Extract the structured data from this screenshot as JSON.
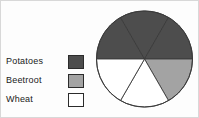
{
  "legend": {
    "items": [
      {
        "label": "Potatoes",
        "color": "#4d4d4d",
        "swatch": "dark-gray-swatch"
      },
      {
        "label": "Beetroot",
        "color": "#a3a3a3",
        "swatch": "medium-gray-swatch"
      },
      {
        "label": "Wheat",
        "color": "#ffffff",
        "swatch": "white-swatch"
      }
    ]
  },
  "chart_data": {
    "type": "pie",
    "title": "",
    "categories": [
      "Potatoes",
      "Beetroot",
      "Wheat"
    ],
    "values": [
      3,
      1,
      2
    ],
    "value_unit": "sectors",
    "total_sectors": 6,
    "sector_angle_degrees": 60,
    "fractions": [
      "1/2",
      "1/6",
      "1/3"
    ],
    "percentages": [
      50,
      16.7,
      33.3
    ],
    "colors": [
      "#4d4d4d",
      "#a3a3a3",
      "#ffffff"
    ],
    "legend_position": "left",
    "grid": false,
    "sectors": [
      {
        "index": 1,
        "start_deg": 0,
        "end_deg": 60,
        "category": "Potatoes",
        "color": "#4d4d4d"
      },
      {
        "index": 2,
        "start_deg": 60,
        "end_deg": 120,
        "category": "Potatoes",
        "color": "#4d4d4d"
      },
      {
        "index": 3,
        "start_deg": 120,
        "end_deg": 180,
        "category": "Potatoes",
        "color": "#4d4d4d"
      },
      {
        "index": 4,
        "start_deg": 180,
        "end_deg": 240,
        "category": "Beetroot",
        "color": "#a3a3a3"
      },
      {
        "index": 5,
        "start_deg": 240,
        "end_deg": 300,
        "category": "Wheat",
        "color": "#ffffff"
      },
      {
        "index": 6,
        "start_deg": 300,
        "end_deg": 360,
        "category": "Wheat",
        "color": "#ffffff"
      }
    ]
  }
}
